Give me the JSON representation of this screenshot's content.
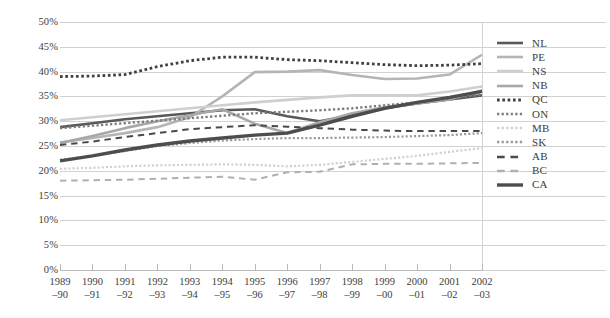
{
  "chart_data": {
    "type": "line",
    "title": "",
    "xlabel": "",
    "ylabel": "",
    "ylim": [
      0,
      50
    ],
    "ytick_step": 5,
    "ytick_labels": [
      "0%",
      "5%",
      "10%",
      "15%",
      "20%",
      "25%",
      "30%",
      "35%",
      "40%",
      "45%",
      "50%"
    ],
    "grid": true,
    "legend_position": "right",
    "categories": [
      "1989–90",
      "1990–91",
      "1991–92",
      "1992–93",
      "1993–94",
      "1994–95",
      "1995–96",
      "1996–97",
      "1997–98",
      "1998–99",
      "1999–00",
      "2000–01",
      "2001–02",
      "2002–03"
    ],
    "series": [
      {
        "name": "NL",
        "style": "solid",
        "color": "#595959",
        "width": 2.6,
        "values": [
          28.8,
          29.6,
          30.4,
          31.0,
          31.6,
          32.2,
          32.4,
          31.0,
          30.0,
          31.2,
          32.6,
          33.6,
          34.4,
          35.2
        ]
      },
      {
        "name": "PE",
        "style": "solid",
        "color": "#b5b5b5",
        "width": 2.6,
        "values": [
          25.7,
          26.6,
          27.6,
          28.8,
          30.8,
          35.0,
          39.9,
          40.0,
          40.3,
          39.3,
          38.5,
          38.6,
          39.4,
          43.4
        ]
      },
      {
        "name": "NS",
        "style": "solid",
        "color": "#cfcfcf",
        "width": 2.6,
        "values": [
          30.2,
          30.8,
          31.4,
          32.0,
          32.6,
          33.2,
          33.8,
          34.3,
          34.8,
          35.2,
          35.2,
          35.2,
          36.0,
          37.0
        ]
      },
      {
        "name": "NB",
        "style": "solid",
        "color": "#a8a8a8",
        "width": 2.6,
        "values": [
          25.6,
          27.0,
          28.6,
          30.0,
          31.2,
          32.4,
          29.5,
          27.6,
          29.8,
          31.6,
          32.8,
          33.6,
          34.4,
          36.2
        ]
      },
      {
        "name": "QC",
        "style": "dotted",
        "color": "#404040",
        "width": 2.8,
        "values": [
          39.0,
          39.1,
          39.4,
          41.0,
          42.2,
          42.9,
          42.9,
          42.4,
          42.2,
          41.8,
          41.4,
          41.2,
          41.3,
          41.6
        ]
      },
      {
        "name": "ON",
        "style": "dotted",
        "color": "#7d7d7d",
        "width": 2.4,
        "values": [
          28.6,
          29.1,
          29.6,
          30.1,
          30.6,
          31.1,
          31.6,
          31.9,
          32.2,
          32.6,
          33.2,
          33.8,
          34.6,
          35.4
        ]
      },
      {
        "name": "MB",
        "style": "dotted",
        "color": "#d0d0d0",
        "width": 2.2,
        "values": [
          20.4,
          20.6,
          20.9,
          21.1,
          21.2,
          21.3,
          21.2,
          20.9,
          21.2,
          21.8,
          22.4,
          23.0,
          23.8,
          24.6
        ]
      },
      {
        "name": "SK",
        "style": "dotted",
        "color": "#9a9a9a",
        "width": 2.2,
        "values": [
          22.2,
          23.0,
          24.0,
          25.0,
          25.6,
          26.1,
          26.4,
          26.6,
          26.6,
          26.7,
          26.8,
          27.0,
          27.2,
          27.6
        ]
      },
      {
        "name": "AB",
        "style": "dashed",
        "color": "#4a4a4a",
        "width": 2.0,
        "values": [
          25.2,
          25.9,
          26.8,
          27.6,
          28.4,
          28.8,
          29.2,
          28.9,
          28.6,
          28.3,
          28.1,
          28.0,
          28.0,
          28.0
        ]
      },
      {
        "name": "BC",
        "style": "dashed",
        "color": "#b0b0b0",
        "width": 2.0,
        "values": [
          18.0,
          18.1,
          18.2,
          18.4,
          18.6,
          18.8,
          18.2,
          19.7,
          19.8,
          21.3,
          21.4,
          21.4,
          21.5,
          21.6
        ]
      },
      {
        "name": "CA",
        "style": "solid",
        "color": "#4d4d4d",
        "width": 3.4,
        "values": [
          22.0,
          23.0,
          24.2,
          25.2,
          26.0,
          26.6,
          27.2,
          27.6,
          29.2,
          31.0,
          32.6,
          33.8,
          34.8,
          36.0
        ]
      }
    ]
  },
  "legend": {
    "items": [
      {
        "label": "NL"
      },
      {
        "label": "PE"
      },
      {
        "label": "NS"
      },
      {
        "label": "NB"
      },
      {
        "label": "QC"
      },
      {
        "label": "ON"
      },
      {
        "label": "MB"
      },
      {
        "label": "SK"
      },
      {
        "label": "AB"
      },
      {
        "label": "BC"
      },
      {
        "label": "CA"
      }
    ]
  }
}
